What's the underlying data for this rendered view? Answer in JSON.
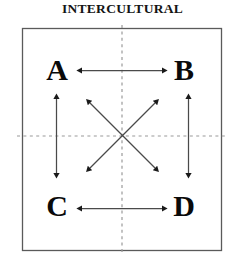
{
  "figure": {
    "title": "INTERCULTURAL",
    "type": "conceptual-diagram",
    "frame": {
      "shape": "square",
      "stroke_color": "#555555",
      "fill_color": "#ffffff"
    },
    "divider_lines": {
      "style": "dashed",
      "color": "#999999",
      "vertical_label": "",
      "horizontal_label": ""
    },
    "nodes": [
      {
        "id": "a",
        "label": "A",
        "quadrant": "top-left"
      },
      {
        "id": "b",
        "label": "B",
        "quadrant": "top-right"
      },
      {
        "id": "c",
        "label": "C",
        "quadrant": "bottom-left"
      },
      {
        "id": "d",
        "label": "D",
        "quadrant": "bottom-right"
      }
    ],
    "connections": [
      {
        "from": "A",
        "to": "B",
        "direction": "bidirectional",
        "orientation": "horizontal-top"
      },
      {
        "from": "C",
        "to": "D",
        "direction": "bidirectional",
        "orientation": "horizontal-bottom"
      },
      {
        "from": "A",
        "to": "C",
        "direction": "bidirectional",
        "orientation": "vertical-left"
      },
      {
        "from": "B",
        "to": "D",
        "direction": "bidirectional",
        "orientation": "vertical-right"
      },
      {
        "from": "A",
        "to": "D",
        "direction": "bidirectional",
        "orientation": "diagonal-nw-se"
      },
      {
        "from": "B",
        "to": "C",
        "direction": "bidirectional",
        "orientation": "diagonal-ne-sw"
      }
    ],
    "arrow_color": "#1a1a1a"
  }
}
